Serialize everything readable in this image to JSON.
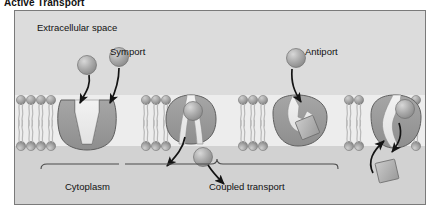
{
  "title": "Active Transport",
  "labels": {
    "extracellular": "Extracellular space",
    "symport": "Symport",
    "antiport": "Antiport",
    "cytoplasm": "Cytoplasm",
    "coupled_transport": "Coupled transport"
  },
  "colors": {
    "panel_background": "#d8d8d8",
    "extracellular_background": "#dcdcdc",
    "cytoplasm_background": "#d2d2d2",
    "membrane_band": "#ededed",
    "protein_fill": "#9a9a9a",
    "protein_fill_light": "#b6b6b6",
    "channel_lumen": "#e9e9e9",
    "lipid_head": "#9e9e9e",
    "lipid_tail": "#cfcfcf",
    "solute_sphere": "#a8a8a8",
    "solute_square": "#b0b0b0",
    "arrow": "#1a1a1a",
    "border": "#7a7a7a"
  },
  "diagram": {
    "type": "cell-membrane-transport",
    "membrane_top_y": 84,
    "membrane_bottom_y": 135,
    "transporters": [
      {
        "name": "uniport-open-transporter",
        "x": 68,
        "mode": "open-outward"
      },
      {
        "name": "symport-transporter",
        "x": 175,
        "mode": "symport-occluded"
      },
      {
        "name": "antiport-transporter-loaded",
        "x": 285,
        "mode": "antiport-loaded"
      },
      {
        "name": "antiport-transporter-release",
        "x": 385,
        "mode": "antiport-release"
      }
    ],
    "solutes": [
      {
        "shape": "sphere",
        "name": "solute-sphere-1",
        "cx": 72,
        "cy": 54
      },
      {
        "shape": "sphere",
        "name": "solute-sphere-2",
        "cx": 104,
        "cy": 46
      },
      {
        "shape": "sphere",
        "name": "solute-sphere-3",
        "cx": 178,
        "cy": 100
      },
      {
        "shape": "sphere",
        "name": "solute-sphere-4",
        "cx": 188,
        "cy": 146
      },
      {
        "shape": "sphere",
        "name": "solute-sphere-5",
        "cx": 281,
        "cy": 47
      },
      {
        "shape": "sphere",
        "name": "solute-sphere-6",
        "cx": 390,
        "cy": 98
      },
      {
        "shape": "square",
        "name": "solute-square-1",
        "cx": 293,
        "cy": 117
      },
      {
        "shape": "square",
        "name": "solute-square-2",
        "cx": 372,
        "cy": 160
      }
    ],
    "arrows": [
      {
        "name": "arrow-influx-1",
        "direction": "inward"
      },
      {
        "name": "arrow-influx-2",
        "direction": "inward"
      },
      {
        "name": "arrow-efflux-1",
        "direction": "inward"
      },
      {
        "name": "arrow-efflux-2",
        "direction": "inward"
      },
      {
        "name": "arrow-antiport-in",
        "direction": "inward"
      },
      {
        "name": "arrow-antiport-up",
        "direction": "outward"
      },
      {
        "name": "arrow-antiport-down",
        "direction": "inward"
      }
    ]
  }
}
